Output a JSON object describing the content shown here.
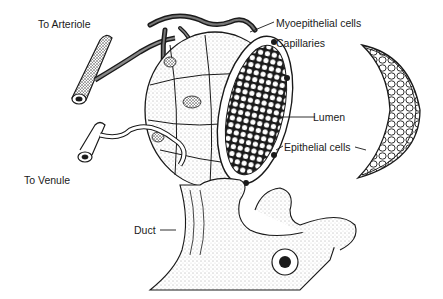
{
  "diagram": {
    "type": "anatomical-illustration",
    "labels": {
      "to_arteriole": "To Arteriole",
      "myoepithelial_cells": "Myoepithelial cells",
      "capillaries": "Capillaries",
      "lumen": "Lumen",
      "epithelial_cells": "Epithelial cells",
      "to_venule": "To Venule",
      "duct": "Duct"
    },
    "colors": {
      "ink": "#1a1a1a",
      "background": "#ffffff",
      "stipple": "#555555"
    }
  }
}
